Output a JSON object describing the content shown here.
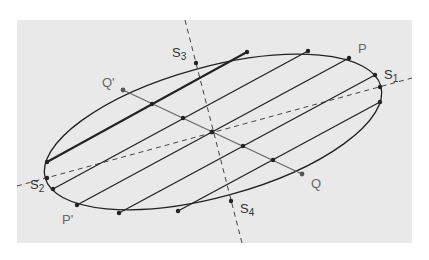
{
  "figure": {
    "panel_color": "#e9e9e9",
    "line_color": "#222222",
    "secondary_line_color": "#555555"
  },
  "labels": {
    "S1": {
      "base": "S",
      "sub": "1"
    },
    "S2": {
      "base": "S",
      "sub": "2"
    },
    "S3": {
      "base": "S",
      "sub": "3"
    },
    "S4": {
      "base": "S",
      "sub": "4"
    },
    "P": "P",
    "P_prime": "P'",
    "Q": "Q",
    "Q_prime": "Q'"
  },
  "geometry": {
    "center": [
      212,
      132
    ],
    "points": {
      "S1": [
        380,
        87
      ],
      "S2": [
        47,
        178
      ],
      "S3": [
        196,
        63
      ],
      "S4": [
        231,
        201
      ],
      "P": [
        349,
        58
      ],
      "P_prime": [
        77,
        205
      ],
      "Q": [
        302,
        174
      ],
      "Q_prime": [
        123,
        90
      ]
    },
    "chords": [
      [
        [
          247,
          52
        ],
        [
          47,
          162
        ]
      ],
      [
        [
          308,
          51
        ],
        [
          53,
          189
        ]
      ],
      [
        [
          349,
          58
        ],
        [
          77,
          205
        ]
      ],
      [
        [
          375,
          75
        ],
        [
          119,
          213
        ]
      ],
      [
        [
          380,
          102
        ],
        [
          178,
          211
        ]
      ]
    ],
    "midpoints": [
      [
        152,
        104
      ],
      [
        183,
        118
      ],
      [
        212,
        132
      ],
      [
        243,
        146
      ],
      [
        273,
        160
      ]
    ]
  }
}
